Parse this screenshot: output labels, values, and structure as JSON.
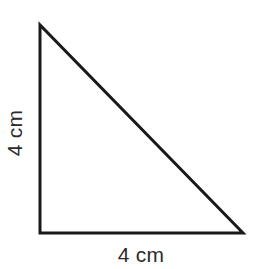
{
  "figure": {
    "type": "right-triangle-diagram",
    "shape_name": "right triangle",
    "stroke_color": "#1a1a1a",
    "fill_color": "#ffffff",
    "background_color": "#ffffff",
    "text_color": "#2b2b2b",
    "stroke_width": 3,
    "vertices": {
      "apex": {
        "x": 40,
        "y": 25
      },
      "bottom_left": {
        "x": 40,
        "y": 233
      },
      "bottom_right": {
        "x": 243,
        "y": 233
      }
    },
    "points_path": "40,25 40,233 243,233",
    "labels": {
      "height": "4 cm",
      "base": "4 cm"
    }
  }
}
